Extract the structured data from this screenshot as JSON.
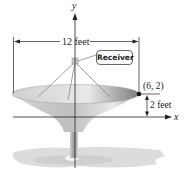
{
  "figure": {
    "type": "parabolic satellite dish diagram",
    "axes": {
      "x_label": "x",
      "y_label": "y"
    },
    "labels": {
      "width": "12 feet",
      "receiver": "Receiver",
      "point": "(6, 2)",
      "depth": "2 feet"
    },
    "colors": {
      "dish": "#bdbdbd",
      "dish_dark": "#8f8f8f",
      "shadow": "#d9d9d9",
      "line": "#222222"
    }
  }
}
